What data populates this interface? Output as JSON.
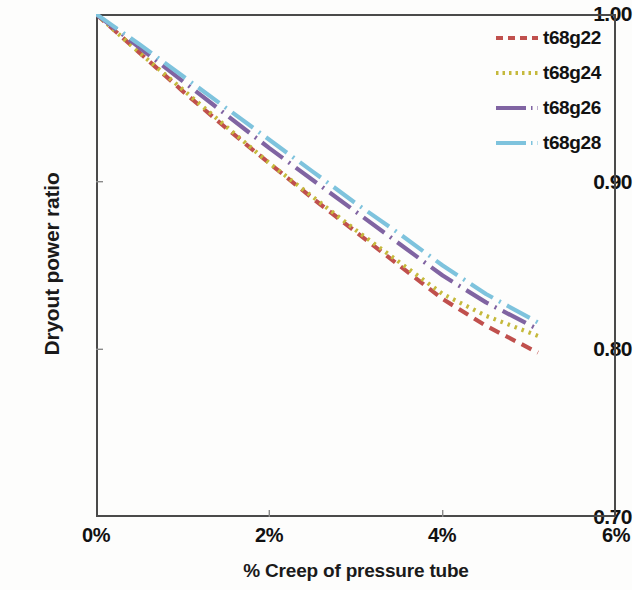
{
  "chart_data": {
    "type": "line",
    "title": "",
    "subtitle": "",
    "xlabel": "% Creep of pressure tube",
    "ylabel": "Dryout power ratio",
    "xlim": [
      0,
      6
    ],
    "ylim": [
      0.7,
      1.0
    ],
    "xticks": [
      0,
      2,
      4,
      6
    ],
    "xtick_labels": [
      "0%",
      "2%",
      "4%",
      "6%"
    ],
    "yticks": [
      0.7,
      0.8,
      0.9,
      1.0
    ],
    "ytick_labels": [
      "0.70",
      "0.80",
      "0.90",
      "1.00"
    ],
    "grid": false,
    "legend_position": "top-right",
    "x_unit": "percent",
    "series": [
      {
        "name": "t68g22",
        "color": "#c0504d",
        "dash_style": "dashed",
        "x": [
          0.0,
          0.5,
          1.0,
          1.5,
          2.0,
          2.5,
          3.0,
          3.5,
          4.0,
          4.5,
          5.1
        ],
        "values": [
          1.0,
          0.977,
          0.954,
          0.932,
          0.911,
          0.89,
          0.87,
          0.85,
          0.83,
          0.814,
          0.798
        ]
      },
      {
        "name": "t68g24",
        "color": "#c5b93c",
        "dash_style": "dotted",
        "x": [
          0.0,
          0.5,
          1.0,
          1.5,
          2.0,
          2.5,
          3.0,
          3.5,
          4.0,
          4.5,
          5.1
        ],
        "values": [
          1.0,
          0.977,
          0.955,
          0.933,
          0.911,
          0.891,
          0.871,
          0.852,
          0.833,
          0.82,
          0.808
        ]
      },
      {
        "name": "t68g26",
        "color": "#8064a2",
        "dash_style": "long-dash",
        "x": [
          0.0,
          0.5,
          1.0,
          1.5,
          2.0,
          2.5,
          3.0,
          3.5,
          4.0,
          4.5,
          5.1
        ],
        "values": [
          1.0,
          0.98,
          0.96,
          0.94,
          0.92,
          0.901,
          0.882,
          0.863,
          0.844,
          0.828,
          0.812
        ]
      },
      {
        "name": "t68g28",
        "color": "#7ec3dd",
        "dash_style": "dash-dot",
        "x": [
          0.0,
          0.5,
          1.0,
          1.5,
          2.0,
          2.5,
          3.0,
          3.5,
          4.0,
          4.5,
          5.1
        ],
        "values": [
          1.0,
          0.982,
          0.963,
          0.944,
          0.925,
          0.906,
          0.887,
          0.869,
          0.85,
          0.833,
          0.816
        ]
      }
    ]
  },
  "axes": {
    "y_title": "Dryout power ratio",
    "x_title": "% Creep of pressure tube",
    "y_labels": [
      "1.00",
      "0.90",
      "0.80",
      "0.70"
    ],
    "x_labels": [
      "0%",
      "2%",
      "4%",
      "6%"
    ]
  },
  "legend": {
    "entries": [
      {
        "label": "t68g22"
      },
      {
        "label": "t68g24"
      },
      {
        "label": "t68g26"
      },
      {
        "label": "t68g28"
      }
    ]
  }
}
